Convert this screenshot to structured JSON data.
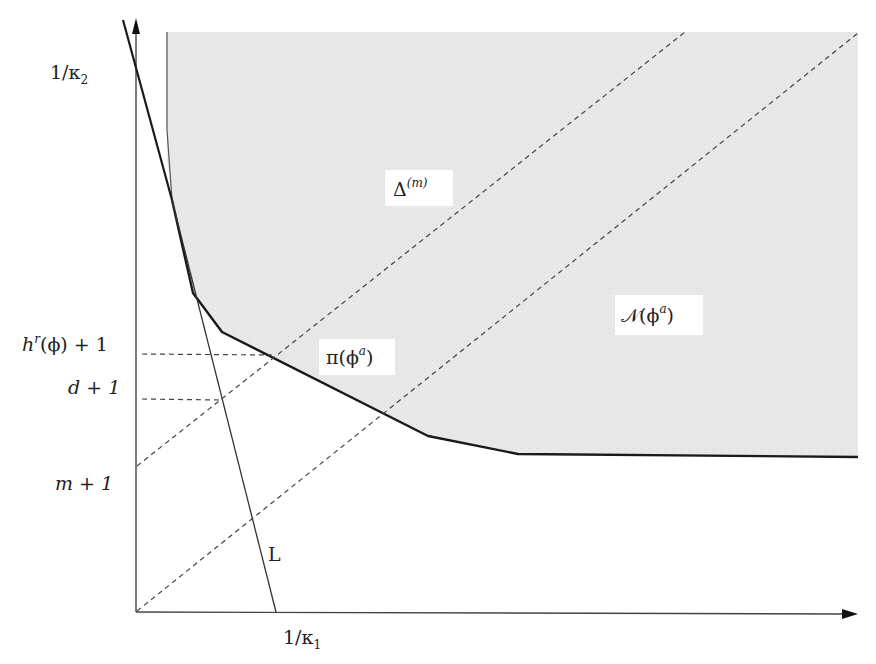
{
  "diagram": {
    "colors": {
      "region_fill": "#e8e8e8",
      "boundary": "#1a1a1a",
      "axis": "#444444",
      "dashed": "#444444",
      "label_bg": "#ffffff"
    },
    "axes": {
      "origin": [
        136,
        612
      ],
      "x_end": [
        858,
        612
      ],
      "y_end": [
        136,
        18
      ],
      "x_tick_label": {
        "base": "1/κ",
        "sub": "1"
      },
      "y_tick_labels": [
        {
          "id": "kappa2",
          "base": "1/κ",
          "sub": "2"
        },
        {
          "id": "hr",
          "text": "h",
          "sup": "r",
          "rest": "(ϕ) + 1"
        },
        {
          "id": "d",
          "text": "d + 1"
        },
        {
          "id": "m",
          "text": "m + 1"
        }
      ]
    },
    "region_labels": {
      "delta": {
        "base": "Δ",
        "sup": "(m)"
      },
      "newton": {
        "base": "𝒩(ϕ",
        "sup": "a",
        "close": ")"
      },
      "pi": {
        "base": "π(ϕ",
        "sup": "a",
        "close": ")"
      },
      "line": "L"
    }
  }
}
